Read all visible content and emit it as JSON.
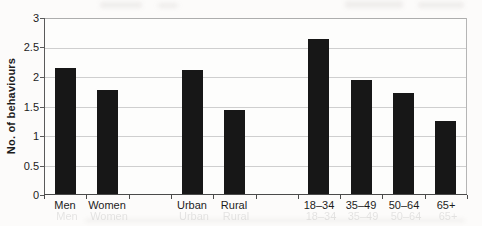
{
  "figure": {
    "ylabel": "No. of behaviours"
  },
  "chart_data": {
    "type": "bar",
    "title": "",
    "xlabel": "",
    "ylabel": "No. of behaviours",
    "ylim": [
      0,
      3
    ],
    "ytick_step": 0.5,
    "grid": true,
    "legend": "none",
    "bar_color": "#171717",
    "gridline_color": "#cfcfcf",
    "categories": [
      "Men",
      "Women",
      "Urban",
      "Rural",
      "18–34",
      "35–49",
      "50–64",
      "65+"
    ],
    "values": [
      2.13,
      1.77,
      2.11,
      1.43,
      2.62,
      1.94,
      1.71,
      1.24
    ],
    "groups": [
      {
        "categories": [
          "Men",
          "Women"
        ],
        "values": [
          2.13,
          1.77
        ]
      },
      {
        "categories": [
          "Urban",
          "Rural"
        ],
        "values": [
          2.11,
          1.43
        ]
      },
      {
        "categories": [
          "18–34",
          "35–49",
          "50–64",
          "65+"
        ],
        "values": [
          2.62,
          1.94,
          1.71,
          1.24
        ]
      }
    ]
  }
}
